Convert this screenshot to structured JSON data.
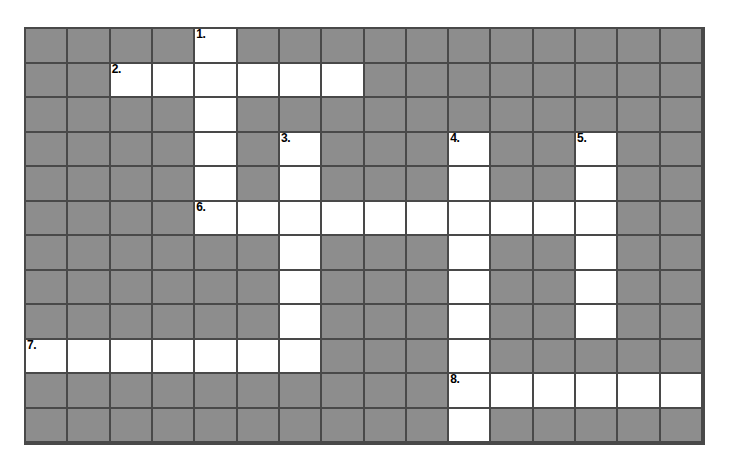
{
  "puzzle": {
    "type": "crossword-grid",
    "columns": 16,
    "rows": 12,
    "colors": {
      "block_fill": "#8d8d8d",
      "open_fill": "#ffffff",
      "grid_line": "#494949",
      "page_background": "#ffffff",
      "number_text": "#000000"
    },
    "clue_numbers": [
      {
        "label": "1.",
        "row": 1,
        "col": 5
      },
      {
        "label": "2.",
        "row": 2,
        "col": 3
      },
      {
        "label": "3.",
        "row": 4,
        "col": 7
      },
      {
        "label": "4.",
        "row": 4,
        "col": 11
      },
      {
        "label": "5.",
        "row": 4,
        "col": 14
      },
      {
        "label": "6.",
        "row": 6,
        "col": 5
      },
      {
        "label": "7.",
        "row": 10,
        "col": 1
      },
      {
        "label": "8.",
        "row": 11,
        "col": 11
      }
    ],
    "open_cells": [
      [
        5
      ],
      [
        3,
        4,
        5,
        6,
        7,
        8
      ],
      [
        5
      ],
      [
        5,
        7,
        11,
        14
      ],
      [
        5,
        7,
        11,
        14
      ],
      [
        5,
        6,
        7,
        8,
        9,
        10,
        11,
        12,
        13,
        14
      ],
      [
        7,
        11,
        14
      ],
      [
        7,
        11,
        14
      ],
      [
        7,
        11,
        14
      ],
      [
        1,
        2,
        3,
        4,
        5,
        6,
        7,
        11
      ],
      [
        11,
        12,
        13,
        14,
        15,
        16
      ],
      [
        11
      ]
    ],
    "entries": [
      {
        "number": "1.",
        "direction": "down",
        "start_row": 1,
        "start_col": 5,
        "length": 6,
        "letters": ""
      },
      {
        "number": "2.",
        "direction": "across",
        "start_row": 2,
        "start_col": 3,
        "length": 6,
        "letters": ""
      },
      {
        "number": "3.",
        "direction": "down",
        "start_row": 4,
        "start_col": 7,
        "length": 7,
        "letters": ""
      },
      {
        "number": "4.",
        "direction": "down",
        "start_row": 4,
        "start_col": 11,
        "length": 9,
        "letters": ""
      },
      {
        "number": "5.",
        "direction": "down",
        "start_row": 4,
        "start_col": 14,
        "length": 6,
        "letters": ""
      },
      {
        "number": "6.",
        "direction": "across",
        "start_row": 6,
        "start_col": 5,
        "length": 10,
        "letters": ""
      },
      {
        "number": "7.",
        "direction": "across",
        "start_row": 10,
        "start_col": 1,
        "length": 7,
        "letters": ""
      },
      {
        "number": "8.",
        "direction": "across",
        "start_row": 11,
        "start_col": 11,
        "length": 6,
        "letters": ""
      }
    ]
  }
}
